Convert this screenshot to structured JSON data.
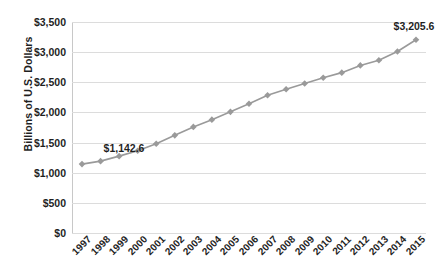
{
  "artifacts": {
    "top_bleed_text": "",
    "bottom_caption_text": ""
  },
  "axes": {
    "y_title": "Billions of U.S. Dollars"
  },
  "chart_data": {
    "type": "line",
    "title": "",
    "xlabel": "",
    "ylabel": "Billions of U.S. Dollars",
    "categories": [
      "1997",
      "1998",
      "1999",
      "2000",
      "2001",
      "2002",
      "2003",
      "2004",
      "2005",
      "2006",
      "2007",
      "2008",
      "2009",
      "2010",
      "2011",
      "2012",
      "2013",
      "2014",
      "2015"
    ],
    "values": [
      1142.6,
      1192.0,
      1275.0,
      1365.0,
      1480.0,
      1620.0,
      1760.0,
      1880.0,
      2010.0,
      2145.0,
      2285.0,
      2385.0,
      2480.0,
      2575.0,
      2660.0,
      2780.0,
      2865.0,
      3010.0,
      3205.6
    ],
    "ylim": [
      0,
      3500
    ],
    "ytick_values": [
      0,
      500,
      1000,
      1500,
      2000,
      2500,
      3000,
      3500
    ],
    "ytick_labels": [
      "$0",
      "$500",
      "$1,000",
      "$1,500",
      "$2,000",
      "$2,500",
      "$3,000",
      "$3,500"
    ],
    "point_labels": [
      {
        "index": 0,
        "text": "$1,142.6"
      },
      {
        "index": 18,
        "text": "$3,205.6"
      }
    ],
    "grid": true,
    "legend": false,
    "legend_position": "none",
    "series_color": "#9a9a9a",
    "marker": "diamond",
    "marker_color": "#9a9a9a",
    "gridline_color": "#dcdcdc",
    "background_color": "#ffffff"
  }
}
